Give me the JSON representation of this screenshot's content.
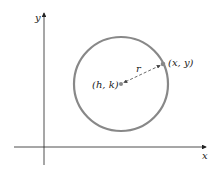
{
  "diagram": {
    "axes": {
      "x_label": "x",
      "y_label": "y"
    },
    "circle": {
      "center_label": "(h, k)",
      "point_label": "(x, y)",
      "radius_label": "r",
      "stroke_color": "#888888"
    },
    "colors": {
      "axis": "#222222",
      "circle": "#888888",
      "point": "#888888"
    }
  }
}
